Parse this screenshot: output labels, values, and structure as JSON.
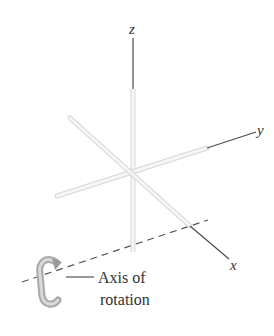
{
  "diagram": {
    "axes": {
      "z": {
        "label": "z"
      },
      "y": {
        "label": "y"
      },
      "x": {
        "label": "x"
      }
    },
    "rotation_axis": {
      "caption_line1": "Axis of",
      "caption_line2": "rotation"
    },
    "colors": {
      "rod_fill": "#f4f4f4",
      "rod_outline": "#d6d6d6",
      "thin_line": "#4a4a4a",
      "dashed_line": "#555555",
      "text": "#333333",
      "rotation_arrow": "#a8a8a8"
    }
  }
}
